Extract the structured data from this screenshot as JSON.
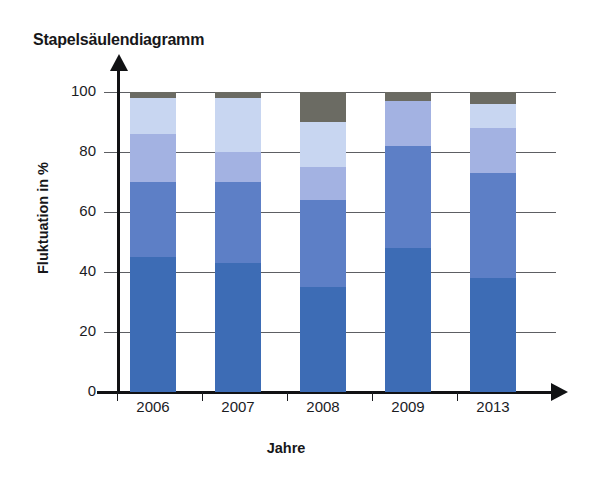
{
  "chart_data": {
    "type": "bar",
    "title": "Stapelsäulendiagramm",
    "subtitle": "",
    "xlabel": "Jahre",
    "ylabel": "Fluktuation in %",
    "stacked": true,
    "grid": true,
    "legend": "none",
    "ylim": [
      0,
      100
    ],
    "yticks": [
      0,
      20,
      40,
      60,
      80,
      100
    ],
    "categories": [
      "2006",
      "2007",
      "2008",
      "2009",
      "2013"
    ],
    "series": [
      {
        "name": "Segment 1",
        "color": "#3d6cb5",
        "values": [
          45,
          43,
          35,
          48,
          38
        ]
      },
      {
        "name": "Segment 2",
        "color": "#5d7fc6",
        "values": [
          25,
          27,
          29,
          34,
          35
        ]
      },
      {
        "name": "Segment 3",
        "color": "#a3b2e2",
        "values": [
          16,
          10,
          11,
          15,
          15
        ]
      },
      {
        "name": "Segment 4",
        "color": "#c8d6f1",
        "values": [
          12,
          18,
          15,
          0,
          8
        ]
      },
      {
        "name": "Segment 5",
        "color": "#6b6b63",
        "values": [
          2,
          2,
          10,
          3,
          4
        ]
      }
    ],
    "annotations": []
  },
  "axis": {
    "y_tick_labels": [
      "0",
      "20",
      "40",
      "60",
      "80",
      "100"
    ],
    "x_tick_labels": [
      "2006",
      "2007",
      "2008",
      "2009",
      "2013"
    ]
  },
  "colors": {
    "axis": "#111214",
    "grid": "#5d5f63",
    "text": "#17171a",
    "background": "#ffffff"
  }
}
